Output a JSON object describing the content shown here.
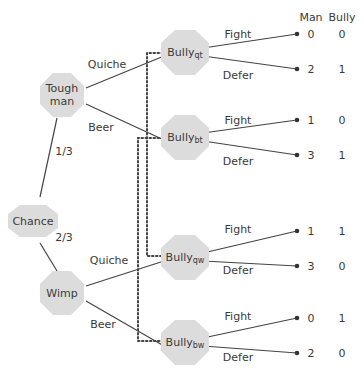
{
  "headers": {
    "man": "Man",
    "bully": "Bully"
  },
  "nodes": {
    "tough": {
      "line1": "Tough",
      "line2": "man"
    },
    "chance": {
      "label": "Chance"
    },
    "wimp": {
      "label": "Wimp"
    },
    "bully_qt": {
      "base": "Bully",
      "sub": "qt"
    },
    "bully_bt": {
      "base": "Bully",
      "sub": "bt"
    },
    "bully_qw": {
      "base": "Bully",
      "sub": "qw"
    },
    "bully_bw": {
      "base": "Bully",
      "sub": "bw"
    }
  },
  "edges": {
    "tough_quiche": "Quiche",
    "tough_beer": "Beer",
    "chance_tough": "1/3",
    "chance_wimp": "2/3",
    "wimp_quiche": "Quiche",
    "wimp_beer": "Beer",
    "fight": "Fight",
    "defer": "Defer"
  },
  "payoffs": [
    {
      "node": "qt",
      "action": "Fight",
      "man": "0",
      "bully": "0"
    },
    {
      "node": "qt",
      "action": "Defer",
      "man": "2",
      "bully": "1"
    },
    {
      "node": "bt",
      "action": "Fight",
      "man": "1",
      "bully": "0"
    },
    {
      "node": "bt",
      "action": "Defer",
      "man": "3",
      "bully": "1"
    },
    {
      "node": "qw",
      "action": "Fight",
      "man": "1",
      "bully": "1"
    },
    {
      "node": "qw",
      "action": "Defer",
      "man": "3",
      "bully": "0"
    },
    {
      "node": "bw",
      "action": "Fight",
      "man": "0",
      "bully": "1"
    },
    {
      "node": "bw",
      "action": "Defer",
      "man": "2",
      "bully": "0"
    }
  ]
}
